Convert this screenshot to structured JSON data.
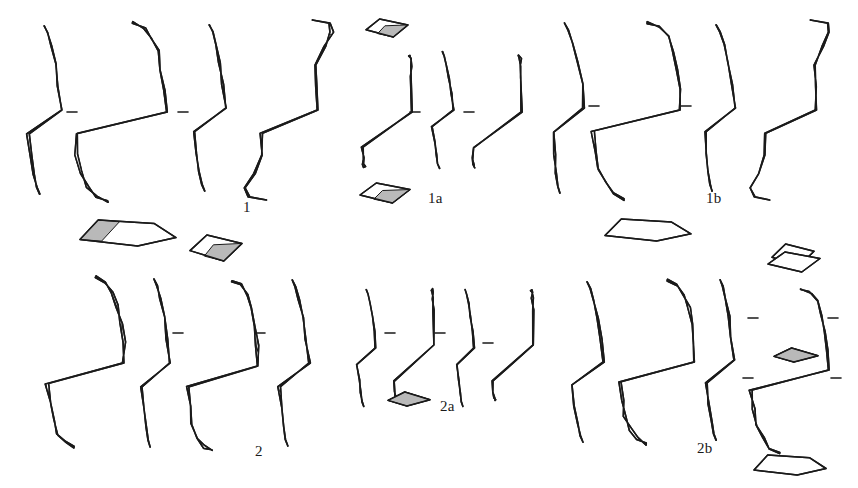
{
  "plate": {
    "kind": "archaeological-lithic-illustration",
    "caption_labels": [
      "1",
      "1a",
      "1b",
      "2",
      "2a",
      "2b"
    ],
    "background_color": "#ffffff",
    "ink_color": "#1a1a1a",
    "cortex_fill_color": "#b9b9b9",
    "scar_fill_color": "#ffffff",
    "width": 858,
    "height": 488
  },
  "labels": [
    {
      "text": "1",
      "x": 243,
      "y": 199,
      "name": "figure-label-1"
    },
    {
      "text": "1a",
      "x": 428,
      "y": 190,
      "name": "figure-label-1a"
    },
    {
      "text": "1b",
      "x": 706,
      "y": 190,
      "name": "figure-label-1b"
    },
    {
      "text": "2",
      "x": 255,
      "y": 443,
      "name": "figure-label-2"
    },
    {
      "text": "2a",
      "x": 440,
      "y": 398,
      "name": "figure-label-2a"
    },
    {
      "text": "2b",
      "x": 697,
      "y": 440,
      "name": "figure-label-2b"
    }
  ],
  "specimens": [
    {
      "id": "1",
      "name": "biface-group-1",
      "label": "1",
      "views": [
        {
          "view": "left-profile",
          "name": "specimen-1-left-profile",
          "cx": 42,
          "cy": 110,
          "w": 36,
          "h": 170,
          "style": "sliver-profile",
          "seed": 11,
          "cortex": 0.55
        },
        {
          "view": "obverse-face",
          "name": "specimen-1-obverse-face",
          "cx": 120,
          "cy": 112,
          "w": 92,
          "h": 182,
          "style": "biface",
          "seed": 12,
          "cortex": 0.42
        },
        {
          "view": "right-profile",
          "name": "specimen-1-right-profile",
          "cx": 207,
          "cy": 108,
          "w": 34,
          "h": 168,
          "style": "sliver-profile",
          "seed": 13,
          "cortex": 0.5
        },
        {
          "view": "reverse-face",
          "name": "specimen-1-reverse-face",
          "cx": 289,
          "cy": 110,
          "w": 86,
          "h": 180,
          "style": "cortex-core",
          "seed": 14,
          "cortex": 0.3
        }
      ],
      "sections": [
        {
          "name": "specimen-1-section-a",
          "cx": 128,
          "cy": 233,
          "w": 96,
          "h": 26,
          "shape": "trapezoid-shaded",
          "seed": 15
        },
        {
          "name": "specimen-1-section-b",
          "cx": 216,
          "cy": 248,
          "w": 52,
          "h": 26,
          "shape": "rhomb-shaded",
          "seed": 16
        }
      ],
      "ticks": [
        {
          "name": "specimen-1-tick-1",
          "x": 72,
          "y": 112
        },
        {
          "name": "specimen-1-tick-2",
          "x": 183,
          "y": 112
        }
      ]
    },
    {
      "id": "1a",
      "name": "flake-group-1a",
      "label": "1a",
      "views": [
        {
          "view": "obverse-face",
          "name": "specimen-1a-obverse-face",
          "cx": 387,
          "cy": 112,
          "w": 50,
          "h": 112,
          "style": "blocky-core",
          "seed": 21,
          "cortex": 0.75
        },
        {
          "view": "right-profile",
          "name": "specimen-1a-right-profile",
          "cx": 441,
          "cy": 110,
          "w": 22,
          "h": 118,
          "style": "thin-profile",
          "seed": 22,
          "cortex": 0.8
        },
        {
          "view": "reverse-face",
          "name": "specimen-1a-reverse-face",
          "cx": 497,
          "cy": 112,
          "w": 50,
          "h": 112,
          "style": "blocky-core",
          "seed": 23,
          "cortex": 0.78
        }
      ],
      "sections": [
        {
          "name": "specimen-1a-section-top",
          "cx": 387,
          "cy": 28,
          "w": 42,
          "h": 18,
          "shape": "rhomb-shaded",
          "seed": 24
        },
        {
          "name": "specimen-1a-section-bottom",
          "cx": 385,
          "cy": 193,
          "w": 50,
          "h": 20,
          "shape": "rhomb-shaded",
          "seed": 25
        }
      ],
      "ticks": [
        {
          "name": "specimen-1a-tick-1",
          "x": 415,
          "y": 112
        },
        {
          "name": "specimen-1a-tick-2",
          "x": 469,
          "y": 112
        }
      ]
    },
    {
      "id": "1b",
      "name": "biface-group-1b",
      "label": "1b",
      "views": [
        {
          "view": "left-profile",
          "name": "specimen-1b-left-profile",
          "cx": 562,
          "cy": 108,
          "w": 34,
          "h": 172,
          "style": "crescent-profile",
          "seed": 31,
          "cortex": 0.18
        },
        {
          "view": "obverse-face",
          "name": "specimen-1b-obverse-face",
          "cx": 636,
          "cy": 110,
          "w": 88,
          "h": 178,
          "style": "biface",
          "seed": 32,
          "cortex": 0.12
        },
        {
          "view": "right-profile",
          "name": "specimen-1b-right-profile",
          "cx": 714,
          "cy": 108,
          "w": 32,
          "h": 168,
          "style": "crescent-profile",
          "seed": 33,
          "cortex": 0.2
        },
        {
          "view": "reverse-face",
          "name": "specimen-1b-reverse-face",
          "cx": 790,
          "cy": 110,
          "w": 78,
          "h": 180,
          "style": "cortex-core",
          "seed": 34,
          "cortex": 0.1
        }
      ],
      "sections": [
        {
          "name": "specimen-1b-section-a",
          "cx": 648,
          "cy": 230,
          "w": 86,
          "h": 22,
          "shape": "trapezoid-plain",
          "seed": 35
        },
        {
          "name": "specimen-1b-section-b",
          "cx": 793,
          "cy": 255,
          "w": 42,
          "h": 22,
          "shape": "rhomb-plain",
          "seed": 36
        }
      ],
      "ticks": [
        {
          "name": "specimen-1b-tick-1",
          "x": 594,
          "y": 106
        },
        {
          "name": "specimen-1b-tick-2",
          "x": 686,
          "y": 106
        }
      ]
    },
    {
      "id": "2",
      "name": "biface-group-2",
      "label": "2",
      "views": [
        {
          "view": "obverse-face",
          "name": "specimen-2-obverse-face",
          "cx": 85,
          "cy": 363,
          "w": 78,
          "h": 172,
          "style": "biface",
          "seed": 41,
          "cortex": 0.48
        },
        {
          "view": "left-profile",
          "name": "specimen-2-left-profile",
          "cx": 152,
          "cy": 363,
          "w": 30,
          "h": 170,
          "style": "blade-profile",
          "seed": 42,
          "cortex": 0.35
        },
        {
          "view": "reverse-face",
          "name": "specimen-2-reverse-face",
          "cx": 222,
          "cy": 366,
          "w": 72,
          "h": 172,
          "style": "biface",
          "seed": 43,
          "cortex": 0.4
        },
        {
          "view": "right-profile",
          "name": "specimen-2-right-profile",
          "cx": 290,
          "cy": 363,
          "w": 32,
          "h": 168,
          "style": "blade-profile",
          "seed": 44,
          "cortex": 0.3
        }
      ],
      "sections": [],
      "ticks": [
        {
          "name": "specimen-2-tick-1",
          "x": 178,
          "y": 333
        },
        {
          "name": "specimen-2-tick-2",
          "x": 260,
          "y": 333
        }
      ]
    },
    {
      "id": "2a",
      "name": "point-group-2a",
      "label": "2a",
      "views": [
        {
          "view": "obverse-face",
          "name": "specimen-2a-obverse-face",
          "cx": 365,
          "cy": 348,
          "w": 20,
          "h": 118,
          "style": "thin-profile",
          "seed": 51,
          "cortex": 0.7
        },
        {
          "view": "reverse-face",
          "name": "specimen-2a-reverse-face",
          "cx": 414,
          "cy": 345,
          "w": 40,
          "h": 112,
          "style": "blocky-core",
          "seed": 52,
          "cortex": 0.72
        },
        {
          "view": "right-profile",
          "name": "specimen-2a-right-profile",
          "cx": 464,
          "cy": 348,
          "w": 18,
          "h": 118,
          "style": "thin-profile",
          "seed": 53,
          "cortex": 0.68
        },
        {
          "view": "far-face",
          "name": "specimen-2a-far-face",
          "cx": 513,
          "cy": 345,
          "w": 40,
          "h": 112,
          "style": "blocky-core",
          "seed": 54,
          "cortex": 0.74
        }
      ],
      "sections": [
        {
          "name": "specimen-2a-section-a",
          "cx": 409,
          "cy": 399,
          "w": 42,
          "h": 14,
          "shape": "sliver-shaded",
          "seed": 55
        },
        {
          "name": "specimen-2a-section-b",
          "cx": 796,
          "cy": 355,
          "w": 44,
          "h": 14,
          "shape": "sliver-shaded",
          "seed": 56
        }
      ],
      "ticks": [
        {
          "name": "specimen-2a-tick-1",
          "x": 390,
          "y": 333
        },
        {
          "name": "specimen-2a-tick-2",
          "x": 440,
          "y": 333
        },
        {
          "name": "specimen-2a-tick-3",
          "x": 488,
          "y": 343
        }
      ]
    },
    {
      "id": "2b",
      "name": "biface-group-2b",
      "label": "2b",
      "views": [
        {
          "view": "left-profile",
          "name": "specimen-2b-left-profile",
          "cx": 585,
          "cy": 362,
          "w": 34,
          "h": 162,
          "style": "hollow-profile",
          "seed": 61,
          "cortex": 0.05
        },
        {
          "view": "obverse-face",
          "name": "specimen-2b-obverse-face",
          "cx": 657,
          "cy": 362,
          "w": 76,
          "h": 164,
          "style": "biface-plain",
          "seed": 62,
          "cortex": 0.04
        },
        {
          "view": "right-profile",
          "name": "specimen-2b-right-profile",
          "cx": 718,
          "cy": 360,
          "w": 30,
          "h": 162,
          "style": "hollow-profile",
          "seed": 63,
          "cortex": 0.06
        },
        {
          "view": "reverse-face",
          "name": "specimen-2b-reverse-face",
          "cx": 790,
          "cy": 370,
          "w": 78,
          "h": 166,
          "style": "biface-plain",
          "seed": 64,
          "cortex": 0.05
        }
      ],
      "sections": [
        {
          "name": "specimen-2b-section-top",
          "cx": 794,
          "cy": 262,
          "w": 52,
          "h": 20,
          "shape": "rhomb-plain",
          "seed": 65
        },
        {
          "name": "specimen-2b-section-bottom",
          "cx": 790,
          "cy": 465,
          "w": 72,
          "h": 20,
          "shape": "trapezoid-plain",
          "seed": 66
        }
      ],
      "ticks": [
        {
          "name": "specimen-2b-tick-1",
          "x": 753,
          "y": 318
        },
        {
          "name": "specimen-2b-tick-2",
          "x": 833,
          "y": 318
        },
        {
          "name": "specimen-2b-tick-3",
          "x": 748,
          "y": 378
        },
        {
          "name": "specimen-2b-tick-4",
          "x": 836,
          "y": 378
        }
      ]
    }
  ]
}
